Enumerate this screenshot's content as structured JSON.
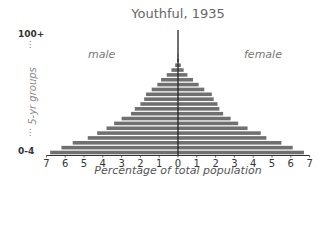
{
  "chart_data": {
    "type": "bar",
    "subtype": "population-pyramid",
    "title": "Youthful, 1935",
    "xlabel": "Percentage of total population",
    "ylabel": "5-yr groups",
    "y_top_label": "100+",
    "y_bottom_label": "0-4",
    "xlim": [
      -7,
      7
    ],
    "x_ticks": [
      "7",
      "6",
      "5",
      "4",
      "3",
      "2",
      "1",
      "0",
      "1",
      "2",
      "3",
      "4",
      "5",
      "6",
      "7"
    ],
    "grid": false,
    "legend": "inline labels: male (left), female (right)",
    "bar_color": "#707070",
    "series": [
      {
        "name": "male",
        "side": "left",
        "categories_bottom_to_top": [
          "0-4",
          "5-9",
          "10-14",
          "15-19",
          "20-24",
          "25-29",
          "30-34",
          "35-39",
          "40-44",
          "45-49",
          "50-54",
          "55-59",
          "60-64",
          "65-69",
          "70-74",
          "75-79",
          "80-84",
          "85-89",
          "90-94",
          "95-99",
          "100+"
        ],
        "values": [
          6.8,
          6.2,
          5.6,
          4.8,
          4.3,
          3.8,
          3.4,
          3.0,
          2.5,
          2.3,
          2.0,
          1.8,
          1.7,
          1.4,
          1.1,
          0.9,
          0.6,
          0.35,
          0.15,
          0.05,
          0.02
        ]
      },
      {
        "name": "female",
        "side": "right",
        "categories_bottom_to_top": [
          "0-4",
          "5-9",
          "10-14",
          "15-19",
          "20-24",
          "25-29",
          "30-34",
          "35-39",
          "40-44",
          "45-49",
          "50-54",
          "55-59",
          "60-64",
          "65-69",
          "70-74",
          "75-79",
          "80-84",
          "85-89",
          "90-94",
          "95-99",
          "100+"
        ],
        "values": [
          6.7,
          6.1,
          5.5,
          4.7,
          4.4,
          3.7,
          3.2,
          2.8,
          2.4,
          2.2,
          2.1,
          1.9,
          1.8,
          1.4,
          1.1,
          0.8,
          0.5,
          0.3,
          0.15,
          0.05,
          0.02
        ]
      }
    ]
  },
  "labels": {
    "title": "Youthful, 1935",
    "male": "male",
    "female": "female",
    "y_top": "100+",
    "y_bottom": "0-4",
    "y_axis_title": "5-yr groups",
    "x_axis_title": "Percentage of total population",
    "dots": "⋮"
  }
}
